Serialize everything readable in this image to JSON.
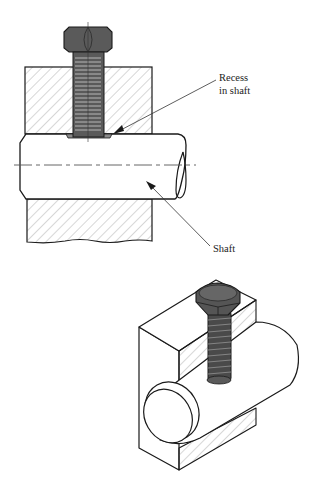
{
  "figure": {
    "labels": {
      "recess_line1": "Recess",
      "recess_line2": "in shaft",
      "shaft": "Shaft"
    },
    "colors": {
      "line": "#1a1a1a",
      "hatch": "#9a9a9a",
      "bolt_fill": "#5a5a5a",
      "bolt_dark": "#3c3c3c",
      "background": "#ffffff"
    }
  }
}
